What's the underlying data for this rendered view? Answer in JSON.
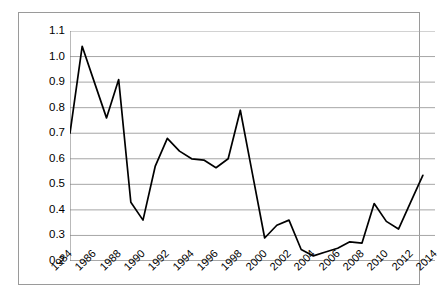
{
  "chart_data": {
    "type": "line",
    "title": "",
    "subtitle": "",
    "xlabel": "",
    "ylabel": "",
    "grid": true,
    "legend": false,
    "legend_position": "none",
    "line_color": "#000000",
    "gridline_color": "#a6a6a6",
    "axis_color": "#7f7f7f",
    "background_color": "#ffffff",
    "xlim": [
      1984,
      2014
    ],
    "ylim": [
      0.2,
      1.1
    ],
    "y_ticks": [
      0.2,
      0.3,
      0.4,
      0.5,
      0.6,
      0.7,
      0.8,
      0.9,
      1.0,
      1.1
    ],
    "y_tick_labels": [
      "0.2",
      "0.3",
      "0.4",
      "0.5",
      "0.6",
      "0.7",
      "0.8",
      "0.9",
      "1.0",
      "1.1"
    ],
    "x_ticks": [
      1984,
      1986,
      1988,
      1990,
      1992,
      1994,
      1996,
      1998,
      2000,
      2002,
      2004,
      2006,
      2008,
      2010,
      2012,
      2014
    ],
    "x_tick_labels": [
      "1984",
      "1986",
      "1988",
      "1990",
      "1992",
      "1994",
      "1996",
      "1998",
      "2000",
      "2002",
      "2004",
      "2006",
      "2008",
      "2010",
      "2012",
      "2014"
    ],
    "x": [
      1984,
      1985,
      1986,
      1987,
      1988,
      1989,
      1990,
      1991,
      1992,
      1993,
      1994,
      1995,
      1996,
      1997,
      1998,
      1999,
      2000,
      2001,
      2002,
      2003,
      2004,
      2005,
      2006,
      2007,
      2008,
      2009,
      2010,
      2011,
      2012,
      2013
    ],
    "values": [
      0.7,
      1.04,
      0.9,
      0.76,
      0.91,
      0.43,
      0.36,
      0.57,
      0.68,
      0.63,
      0.6,
      0.595,
      0.565,
      0.6,
      0.79,
      0.54,
      0.29,
      0.34,
      0.36,
      0.245,
      0.22,
      0.235,
      0.25,
      0.275,
      0.27,
      0.425,
      0.355,
      0.325,
      0.43,
      0.535
    ],
    "series": [
      {
        "name": "series-1",
        "values": [
          0.7,
          1.04,
          0.9,
          0.76,
          0.91,
          0.43,
          0.36,
          0.57,
          0.68,
          0.63,
          0.6,
          0.595,
          0.565,
          0.6,
          0.79,
          0.54,
          0.29,
          0.34,
          0.36,
          0.245,
          0.22,
          0.235,
          0.25,
          0.275,
          0.27,
          0.425,
          0.355,
          0.325,
          0.43,
          0.535
        ]
      }
    ]
  }
}
